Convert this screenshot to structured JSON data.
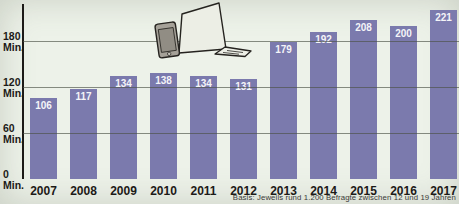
{
  "chart_data": {
    "type": "bar",
    "title": "",
    "categories": [
      "2007",
      "2008",
      "2009",
      "2010",
      "2011",
      "2012",
      "2013",
      "2014",
      "2015",
      "2016",
      "2017"
    ],
    "values": [
      106,
      117,
      134,
      138,
      134,
      131,
      179,
      192,
      208,
      200,
      221
    ],
    "unit_label": "Min.",
    "ylabel": "Min.",
    "yticks": [
      180,
      120,
      60,
      0
    ],
    "ylim": [
      0,
      235
    ],
    "grid": true,
    "legend_position": "none",
    "footnote": "Basis: Jeweils rund 1.200 Befragte zwischen 12 und 19 Jahren"
  },
  "colors": {
    "background": "#edf2e9",
    "bar": "#7b7aad",
    "bar_label": "#f4f4f8",
    "axis": "#1c1a17",
    "grid": "rgba(75,82,70,0.65)",
    "tick_label": "#1c1a17",
    "footnote_text": "#3a3a38",
    "device_body": "#a5a198",
    "device_screen": "#918d84",
    "laptop_fill": "#eceee5",
    "outline": "#25231f"
  },
  "icons": [
    {
      "name": "smartphone-icon",
      "meaning": "smartphone clip art"
    },
    {
      "name": "laptop-icon",
      "meaning": "open laptop clip art"
    }
  ]
}
